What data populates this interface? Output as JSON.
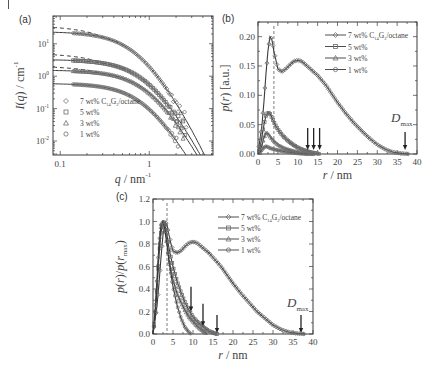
{
  "figure": {
    "panels": [
      "(a)",
      "(b)",
      "(c)"
    ]
  },
  "chart_data": [
    {
      "panel": "(a)",
      "type": "scatter",
      "xscale": "log",
      "yscale": "log",
      "xlabel": "q / nm⁻¹",
      "ylabel": "I(q) / cm⁻¹",
      "xlim": [
        0.083,
        5.2
      ],
      "ylim": [
        0.0037,
        72
      ],
      "xticks": [
        {
          "v": 0.1,
          "label": "0.1"
        },
        {
          "v": 1,
          "label": "1"
        }
      ],
      "yticks": [
        {
          "v": 10,
          "label": "10",
          "exp": "1"
        },
        {
          "v": 1,
          "label": "10",
          "exp": "0"
        },
        {
          "v": 0.1,
          "label": "10",
          "exp": "-1"
        },
        {
          "v": 0.01,
          "label": "10",
          "exp": "-2"
        }
      ],
      "legend": {
        "position": "lower left",
        "entries": [
          {
            "marker": "diamond",
            "label": "7 wt% C",
            "sub1": "14",
            "mid": "G",
            "sub2": "2",
            "tail": "/octane"
          },
          {
            "marker": "square",
            "label": "5 wt%"
          },
          {
            "marker": "triangle",
            "label": "3 wt%"
          },
          {
            "marker": "circle",
            "label": "1 wt%"
          }
        ]
      },
      "series": [
        {
          "name": "7 wt%",
          "I0_fit": 24,
          "I0_dash": 32,
          "q_marker_start": 0.14,
          "q_marker_end": 2.6,
          "falloff_q": 0.75,
          "shoulder": 0.45
        },
        {
          "name": "5 wt%",
          "I0_fit": 3.3,
          "I0_dash": 4.6,
          "q_marker_start": 0.14,
          "q_marker_end": 2.5,
          "falloff_q": 0.95,
          "shoulder": 0.3
        },
        {
          "name": "3 wt%",
          "I0_fit": 1.55,
          "I0_dash": 1.9,
          "q_marker_start": 0.14,
          "q_marker_end": 2.4,
          "falloff_q": 1.0,
          "shoulder": 0.25
        },
        {
          "name": "1 wt%",
          "I0_fit": 0.6,
          "I0_dash": 0.6,
          "q_marker_start": 0.14,
          "q_marker_end": 2.1,
          "falloff_q": 0.9,
          "shoulder": 0.2
        }
      ]
    },
    {
      "panel": "(b)",
      "type": "line",
      "xlabel": "r / nm",
      "ylabel": "p(r) [a.u.]",
      "xlim": [
        0,
        40
      ],
      "ylim": [
        0,
        0.225
      ],
      "xticks": [
        0,
        5,
        10,
        15,
        20,
        25,
        30,
        35,
        40
      ],
      "yticks": [
        "0.00",
        "0.05",
        "0.10",
        "0.15",
        "0.20"
      ],
      "dashed_vline_r": 4.0,
      "annotation": {
        "text": "D",
        "sub": "max",
        "r": 37
      },
      "arrows_r": [
        12.5,
        14.0,
        15.5,
        37.0
      ],
      "legend": {
        "position": "upper right",
        "entries": [
          {
            "marker": "diamond",
            "label": "7 wt% C",
            "sub1": "14",
            "mid": "G",
            "sub2": "2",
            "tail": "/octane"
          },
          {
            "marker": "square",
            "label": "5 wt%"
          },
          {
            "marker": "triangle",
            "label": "3 wt%"
          },
          {
            "marker": "circle",
            "label": "1 wt%"
          }
        ]
      },
      "series": [
        {
          "name": "7 wt%",
          "points": [
            [
              0,
              0
            ],
            [
              1,
              0.05
            ],
            [
              1.5,
              0.09
            ],
            [
              2,
              0.135
            ],
            [
              2.5,
              0.175
            ],
            [
              3,
              0.2
            ],
            [
              3.5,
              0.195
            ],
            [
              4,
              0.175
            ],
            [
              4.5,
              0.16
            ],
            [
              5,
              0.145
            ],
            [
              6,
              0.14
            ],
            [
              7,
              0.145
            ],
            [
              8,
              0.152
            ],
            [
              9,
              0.158
            ],
            [
              10,
              0.16
            ],
            [
              11,
              0.158
            ],
            [
              12,
              0.152
            ],
            [
              13,
              0.146
            ],
            [
              14,
              0.14
            ],
            [
              15,
              0.134
            ],
            [
              16,
              0.126
            ],
            [
              17,
              0.118
            ],
            [
              18,
              0.108
            ],
            [
              19,
              0.098
            ],
            [
              20,
              0.088
            ],
            [
              22,
              0.07
            ],
            [
              24,
              0.054
            ],
            [
              26,
              0.04
            ],
            [
              28,
              0.027
            ],
            [
              30,
              0.016
            ],
            [
              32,
              0.008
            ],
            [
              34,
              0.003
            ],
            [
              36,
              0.001
            ],
            [
              38,
              0
            ]
          ]
        },
        {
          "name": "5 wt%",
          "points": [
            [
              0,
              0
            ],
            [
              0.5,
              0.01
            ],
            [
              1,
              0.03
            ],
            [
              1.5,
              0.05
            ],
            [
              2,
              0.065
            ],
            [
              2.5,
              0.071
            ],
            [
              3,
              0.069
            ],
            [
              3.5,
              0.062
            ],
            [
              4,
              0.054
            ],
            [
              5,
              0.042
            ],
            [
              6,
              0.033
            ],
            [
              7,
              0.026
            ],
            [
              8,
              0.02
            ],
            [
              9,
              0.015
            ],
            [
              10,
              0.011
            ],
            [
              11,
              0.008
            ],
            [
              12,
              0.0055
            ],
            [
              13,
              0.0035
            ],
            [
              14,
              0.002
            ],
            [
              15,
              0.0008
            ],
            [
              15.5,
              0
            ]
          ]
        },
        {
          "name": "3 wt%",
          "points": [
            [
              0,
              0
            ],
            [
              0.5,
              0.005
            ],
            [
              1,
              0.015
            ],
            [
              1.5,
              0.028
            ],
            [
              2,
              0.036
            ],
            [
              2.5,
              0.035
            ],
            [
              3,
              0.03
            ],
            [
              4,
              0.022
            ],
            [
              5,
              0.016
            ],
            [
              6,
              0.012
            ],
            [
              7,
              0.009
            ],
            [
              8,
              0.007
            ],
            [
              9,
              0.005
            ],
            [
              10,
              0.0035
            ],
            [
              11,
              0.0022
            ],
            [
              12,
              0.0012
            ],
            [
              13,
              0.0005
            ],
            [
              14,
              0
            ]
          ]
        },
        {
          "name": "1 wt%",
          "points": [
            [
              0,
              0
            ],
            [
              0.5,
              0.003
            ],
            [
              1,
              0.007
            ],
            [
              1.5,
              0.011
            ],
            [
              2,
              0.013
            ],
            [
              2.5,
              0.012
            ],
            [
              3,
              0.01
            ],
            [
              4,
              0.008
            ],
            [
              5,
              0.0065
            ],
            [
              6,
              0.005
            ],
            [
              7,
              0.0038
            ],
            [
              8,
              0.0028
            ],
            [
              9,
              0.0019
            ],
            [
              10,
              0.0012
            ],
            [
              11,
              0.0006
            ],
            [
              12,
              0.0002
            ],
            [
              12.5,
              0
            ]
          ]
        }
      ]
    },
    {
      "panel": "(c)",
      "type": "line",
      "xlabel": "r / nm",
      "ylabel": "p(r)/p(r_max)",
      "xlim": [
        0,
        40
      ],
      "ylim": [
        0,
        1.2
      ],
      "xticks": [
        0,
        5,
        10,
        15,
        20,
        25,
        30,
        35,
        40
      ],
      "yticks": [
        "0.0",
        "0.2",
        "0.4",
        "0.6",
        "0.8",
        "1.0",
        "1.2"
      ],
      "dashed_vline_r": 3.5,
      "annotation": {
        "text": "D",
        "sub": "max",
        "r": 37
      },
      "arrows": [
        {
          "r": 9.5,
          "y_top": 0.42,
          "y_tip": 0.2
        },
        {
          "r": 12.5,
          "y_top": 0.27,
          "y_tip": 0.07
        },
        {
          "r": 16,
          "y_top": 0.17,
          "y_tip": 0.01
        },
        {
          "r": 37,
          "y_top": 0.17,
          "y_tip": 0.01
        }
      ],
      "legend": {
        "position": "upper right",
        "entries": [
          {
            "marker": "diamond",
            "label": "7 wt% C",
            "sub1": "14",
            "mid": "G",
            "sub2": "2",
            "tail": "/octane"
          },
          {
            "marker": "square",
            "label": "5 wt%"
          },
          {
            "marker": "triangle",
            "label": "3 wt%"
          },
          {
            "marker": "circle",
            "label": "1 wt%"
          }
        ]
      },
      "series": [
        {
          "name": "7 wt%",
          "points": [
            [
              0,
              0
            ],
            [
              1,
              0.25
            ],
            [
              1.5,
              0.45
            ],
            [
              2,
              0.68
            ],
            [
              2.5,
              0.88
            ],
            [
              3,
              1.0
            ],
            [
              3.5,
              0.97
            ],
            [
              4,
              0.88
            ],
            [
              4.5,
              0.8
            ],
            [
              5,
              0.74
            ],
            [
              6,
              0.72
            ],
            [
              7,
              0.74
            ],
            [
              8,
              0.78
            ],
            [
              9,
              0.81
            ],
            [
              10,
              0.82
            ],
            [
              11,
              0.81
            ],
            [
              12,
              0.78
            ],
            [
              13,
              0.75
            ],
            [
              14,
              0.72
            ],
            [
              15,
              0.68
            ],
            [
              16,
              0.64
            ],
            [
              17,
              0.6
            ],
            [
              18,
              0.55
            ],
            [
              19,
              0.5
            ],
            [
              20,
              0.45
            ],
            [
              22,
              0.36
            ],
            [
              24,
              0.28
            ],
            [
              26,
              0.2
            ],
            [
              28,
              0.14
            ],
            [
              30,
              0.08
            ],
            [
              32,
              0.04
            ],
            [
              34,
              0.016
            ],
            [
              36,
              0.005
            ],
            [
              38,
              0
            ]
          ]
        },
        {
          "name": "5 wt%",
          "points": [
            [
              0,
              0
            ],
            [
              0.5,
              0.15
            ],
            [
              1,
              0.4
            ],
            [
              1.5,
              0.7
            ],
            [
              2,
              0.9
            ],
            [
              2.5,
              1.0
            ],
            [
              3,
              0.98
            ],
            [
              3.5,
              0.88
            ],
            [
              4,
              0.76
            ],
            [
              5,
              0.6
            ],
            [
              6,
              0.47
            ],
            [
              7,
              0.37
            ],
            [
              8,
              0.28
            ],
            [
              9,
              0.21
            ],
            [
              10,
              0.15
            ],
            [
              11,
              0.11
            ],
            [
              12,
              0.08
            ],
            [
              13,
              0.05
            ],
            [
              14,
              0.025
            ],
            [
              15,
              0.01
            ],
            [
              16,
              0
            ]
          ]
        },
        {
          "name": "3 wt%",
          "points": [
            [
              0,
              0
            ],
            [
              0.5,
              0.15
            ],
            [
              1,
              0.42
            ],
            [
              1.5,
              0.75
            ],
            [
              2,
              0.95
            ],
            [
              2.5,
              1.0
            ],
            [
              3,
              0.92
            ],
            [
              3.5,
              0.8
            ],
            [
              4,
              0.66
            ],
            [
              5,
              0.48
            ],
            [
              6,
              0.36
            ],
            [
              7,
              0.28
            ],
            [
              8,
              0.21
            ],
            [
              9,
              0.15
            ],
            [
              10,
              0.11
            ],
            [
              11,
              0.07
            ],
            [
              12,
              0.04
            ],
            [
              13,
              0.015
            ],
            [
              13.5,
              0
            ]
          ]
        },
        {
          "name": "1 wt%",
          "points": [
            [
              0,
              0
            ],
            [
              0.5,
              0.2
            ],
            [
              1,
              0.5
            ],
            [
              1.5,
              0.8
            ],
            [
              2,
              0.97
            ],
            [
              2.5,
              1.0
            ],
            [
              3,
              0.93
            ],
            [
              3.5,
              0.8
            ],
            [
              4,
              0.64
            ],
            [
              5,
              0.42
            ],
            [
              6,
              0.26
            ],
            [
              7,
              0.14
            ],
            [
              8,
              0.06
            ],
            [
              9,
              0.015
            ],
            [
              9.5,
              0
            ]
          ]
        }
      ]
    }
  ]
}
